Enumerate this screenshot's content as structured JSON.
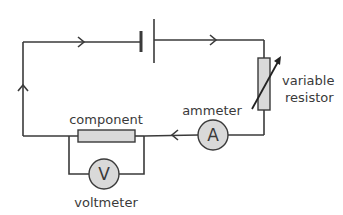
{
  "diagram": {
    "type": "circuit",
    "colors": {
      "line": "#3a3a3a",
      "fill": "#d9d9d9",
      "background": "#ffffff"
    },
    "components": {
      "cell": {
        "symbol": "battery-cell"
      },
      "variable_resistor": {
        "label_line1": "variable",
        "label_line2": "resistor"
      },
      "ammeter": {
        "symbol": "A",
        "label": "ammeter"
      },
      "component": {
        "label": "component"
      },
      "voltmeter": {
        "symbol": "V",
        "label": "voltmeter"
      }
    },
    "current_direction": "clockwise"
  }
}
